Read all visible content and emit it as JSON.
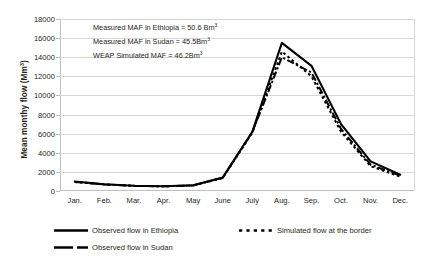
{
  "chart_data": {
    "type": "line",
    "title": "",
    "xlabel": "",
    "ylabel": "Mean monthy flow (Mm",
    "ylabel_sup": "3",
    "ylabel_tail": ")",
    "categories": [
      "Jan.",
      "Feb.",
      "Mar.",
      "Apr.",
      "May",
      "June",
      "July",
      "Aug.",
      "Sep.",
      "Oct.",
      "Nov.",
      "Dec."
    ],
    "ylim": [
      0,
      18000
    ],
    "ytick_step": 2000,
    "yticks": [
      "0",
      "2000",
      "4000",
      "6000",
      "8000",
      "10000",
      "12000",
      "14000",
      "16000",
      "18000"
    ],
    "ytick_values": [
      0,
      2000,
      4000,
      6000,
      8000,
      10000,
      12000,
      14000,
      16000,
      18000
    ],
    "grid": true,
    "legend_position": "bottom",
    "series": [
      {
        "name": "Observed flow in Ethiopia",
        "style": "solid",
        "color": "#000000",
        "values": [
          1000,
          700,
          550,
          500,
          600,
          1400,
          6200,
          15500,
          13100,
          7000,
          3100,
          1700
        ]
      },
      {
        "name": "Simulated flow at the border",
        "style": "dotted",
        "color": "#000000",
        "values": [
          950,
          680,
          540,
          490,
          580,
          1350,
          6100,
          14600,
          12000,
          6200,
          2600,
          1500
        ]
      },
      {
        "name": "Observed flow in Sudan",
        "style": "dash-dot",
        "color": "#000000",
        "values": [
          950,
          680,
          540,
          490,
          580,
          1400,
          6150,
          14000,
          12400,
          6500,
          2750,
          1600
        ]
      }
    ],
    "annotations": [
      {
        "text": "Measured MAF in Ethiopia  = 50.6 Bm",
        "sup": "3"
      },
      {
        "text": "Measured MAF in Sudan = 45.5Bm",
        "sup": "3"
      },
      {
        "text": "WEAP Simulated MAF = 46.2Bm",
        "sup": "3"
      }
    ]
  }
}
